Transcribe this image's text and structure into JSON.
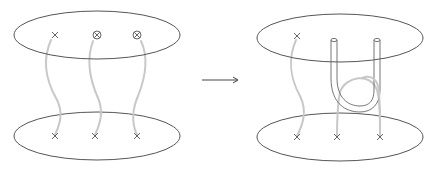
{
  "diagram": {
    "arrow": {
      "symbol": "→"
    },
    "left_figure": {
      "top_disk": {
        "marks": [
          "cross",
          "circled-cross",
          "circled-cross"
        ]
      },
      "bottom_disk": {
        "marks": [
          "cross",
          "cross",
          "cross"
        ]
      },
      "strand_count": 3
    },
    "right_figure": {
      "top_disk": {
        "marks": [
          "cross",
          "tube-end",
          "tube-end"
        ]
      },
      "bottom_disk": {
        "marks": [
          "cross",
          "cross",
          "cross"
        ]
      },
      "strand_count": 3,
      "has_u_tube": true
    },
    "colors": {
      "outline": "#555555",
      "strand": "#c8c8c8",
      "background": "#ffffff"
    }
  }
}
